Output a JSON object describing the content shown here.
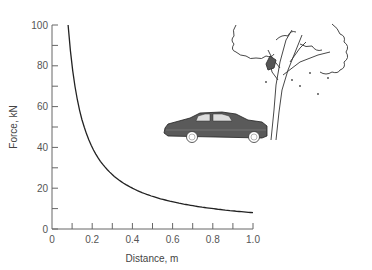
{
  "chart_data": {
    "type": "line",
    "title": "",
    "xlabel": "Distance, m",
    "ylabel": "Force, kN",
    "xlim": [
      0,
      1.0
    ],
    "ylim": [
      0,
      100
    ],
    "x_ticks": [
      "0",
      "0.2",
      "0.4",
      "0.6",
      "0.8",
      "1.0"
    ],
    "y_ticks": [
      "0",
      "20",
      "40",
      "60",
      "80",
      "100"
    ],
    "grid": false,
    "legend": null,
    "series": [
      {
        "name": "Force vs stopping distance",
        "x": [
          0.08,
          0.1,
          0.15,
          0.2,
          0.25,
          0.3,
          0.4,
          0.5,
          0.6,
          0.7,
          0.8,
          0.9,
          1.0
        ],
        "y": [
          100,
          80,
          53,
          40,
          32,
          27,
          20,
          16,
          13,
          11.4,
          10,
          8.9,
          8
        ]
      }
    ],
    "annotations": [
      "Illustration of a car crashed into a tree"
    ],
    "color": "#222222"
  }
}
